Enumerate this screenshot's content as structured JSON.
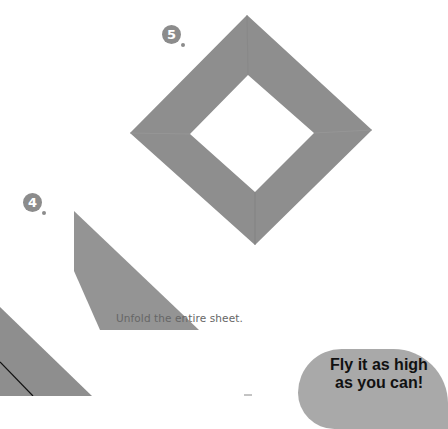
{
  "steps": [
    {
      "number": "5",
      "shape": "square-frame-diamond"
    },
    {
      "number": "4",
      "shape": "folded-strip"
    }
  ],
  "caption": "Unfold the entire sheet.",
  "speech_bubble": {
    "line1": "Fly it as high",
    "line2": "as you can!"
  },
  "colors": {
    "paper_gray": "#8e8e8e",
    "badge_gray": "#8c8c8c",
    "bubble_gray": "#a9a9a9"
  }
}
